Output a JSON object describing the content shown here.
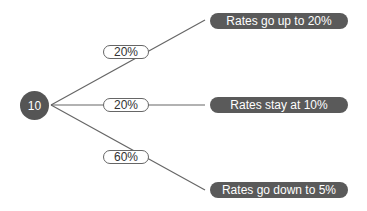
{
  "root": {
    "value": "10"
  },
  "branches": [
    {
      "probability": "20%",
      "outcome": "Rates go up to 20%"
    },
    {
      "probability": "20%",
      "outcome": "Rates stay at 10%"
    },
    {
      "probability": "60%",
      "outcome": "Rates go down to 5%"
    }
  ],
  "colors": {
    "node": "#555555",
    "outcome": "#5a5a5a",
    "line": "#666666"
  }
}
